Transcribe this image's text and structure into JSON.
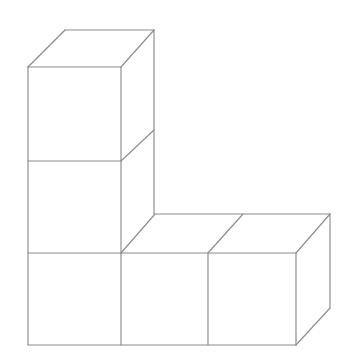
{
  "figure": {
    "description": "Line drawing of five unit cubes arranged in an L shape",
    "background_color": "#ffffff",
    "line_color": "#8c8c8c",
    "face_color": "#ffffff",
    "line_width": 1.15,
    "canvas": {
      "width": 349,
      "height": 360
    },
    "projection": {
      "unit_width": 88,
      "unit_height": 92,
      "depth_dx": 34,
      "depth_dy": -38
    },
    "cube_count": 5,
    "arrangement": {
      "vertical_column_cubes": 3,
      "horizontal_row_cubes": 3,
      "shared_corner_cubes": 1
    },
    "geometry": {
      "front_face_quads": [
        {
          "name": "column-top-front",
          "points": "28,67 121,67 121,161 28,161"
        },
        {
          "name": "column-middle-front",
          "points": "28,161 121,161 121,253 28,253"
        },
        {
          "name": "column-bottom-front",
          "points": "28,253 121,253 121,345 28,345"
        },
        {
          "name": "row-middle-front",
          "points": "121,253 208,253 208,345 121,345"
        },
        {
          "name": "row-right-front",
          "points": "208,253 296,253 296,345 208,345"
        }
      ],
      "top_face_quads": [
        {
          "name": "column-top-cap",
          "points": "28,67 65,30 154,30 121,67"
        },
        {
          "name": "row-middle-cap",
          "points": "121,253 155,214 243,214 208,253"
        },
        {
          "name": "row-right-cap",
          "points": "208,253 243,214 330,214 296,253"
        }
      ],
      "side_face_quads": [
        {
          "name": "column-right-side-upper",
          "points": "121,67 154,30 154,130 121,161"
        },
        {
          "name": "row-right-side",
          "points": "296,253 330,214 330,308 296,345"
        }
      ],
      "edges": [
        {
          "name": "top-cap-back-left",
          "from": [
            28,
            67
          ],
          "to": [
            65,
            30
          ]
        },
        {
          "name": "top-cap-back-top",
          "from": [
            65,
            30
          ],
          "to": [
            154,
            30
          ]
        },
        {
          "name": "top-cap-right",
          "from": [
            154,
            30
          ],
          "to": [
            121,
            67
          ]
        },
        {
          "name": "top-cap-front",
          "from": [
            28,
            67
          ],
          "to": [
            121,
            67
          ]
        },
        {
          "name": "column-left-vertical",
          "from": [
            28,
            67
          ],
          "to": [
            28,
            345
          ]
        },
        {
          "name": "column-front-right-vertical",
          "from": [
            121,
            67
          ],
          "to": [
            121,
            253
          ]
        },
        {
          "name": "column-back-right-vertical",
          "from": [
            154,
            30
          ],
          "to": [
            154,
            214
          ]
        },
        {
          "name": "column-divider-1",
          "from": [
            28,
            161
          ],
          "to": [
            121,
            161
          ]
        },
        {
          "name": "column-divider-2",
          "from": [
            28,
            253
          ],
          "to": [
            121,
            253
          ]
        },
        {
          "name": "column-side-diagonal-1",
          "from": [
            121,
            161
          ],
          "to": [
            154,
            130
          ]
        },
        {
          "name": "column-side-diagonal-2",
          "from": [
            121,
            253
          ],
          "to": [
            155,
            214
          ]
        },
        {
          "name": "row-cap-back",
          "from": [
            155,
            214
          ],
          "to": [
            330,
            214
          ]
        },
        {
          "name": "row-cap-front",
          "from": [
            121,
            253
          ],
          "to": [
            296,
            253
          ]
        },
        {
          "name": "row-cap-divider-diagonal",
          "from": [
            208,
            253
          ],
          "to": [
            243,
            214
          ]
        },
        {
          "name": "row-right-cap-right",
          "from": [
            330,
            214
          ],
          "to": [
            296,
            253
          ]
        },
        {
          "name": "row-front-divider-1",
          "from": [
            121,
            253
          ],
          "to": [
            121,
            345
          ]
        },
        {
          "name": "row-front-divider-2",
          "from": [
            208,
            253
          ],
          "to": [
            208,
            345
          ]
        },
        {
          "name": "row-front-right-vertical",
          "from": [
            296,
            253
          ],
          "to": [
            296,
            345
          ]
        },
        {
          "name": "row-back-right-vertical",
          "from": [
            330,
            214
          ],
          "to": [
            330,
            308
          ]
        },
        {
          "name": "bottom-edge",
          "from": [
            28,
            345
          ],
          "to": [
            296,
            345
          ]
        },
        {
          "name": "bottom-right-diagonal",
          "from": [
            296,
            345
          ],
          "to": [
            330,
            308
          ]
        }
      ]
    }
  }
}
